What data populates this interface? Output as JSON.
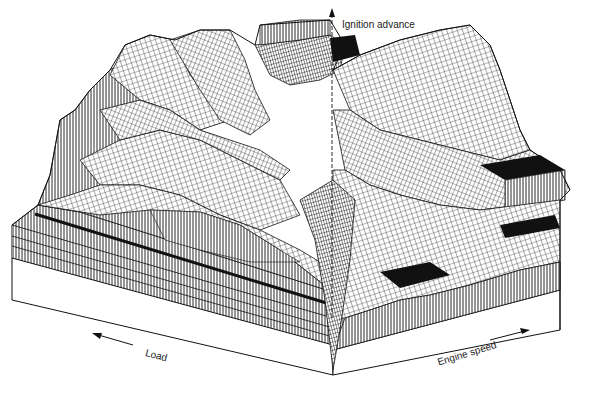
{
  "figure": {
    "type": "3d-surface-map",
    "axes": {
      "vertical": {
        "label": "Ignition advance",
        "direction": "up"
      },
      "left": {
        "label": "Load",
        "direction": "toward-left"
      },
      "right": {
        "label": "Engine speed",
        "direction": "toward-right"
      }
    },
    "colors": {
      "line": "#111111",
      "background": "#ffffff",
      "base_face": "#ffffff"
    }
  }
}
